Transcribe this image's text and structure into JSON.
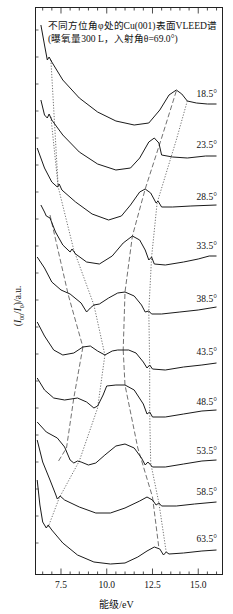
{
  "chart_data": {
    "type": "line",
    "title": "不同方位角φ处的Cu(001)表面VLEED谱",
    "subtitle": "(曝氧量300 L，入射角θ=69.0°)",
    "xlabel": "能级/eV",
    "ylabel": "(I00/I0)/a.u.",
    "xlim": [
      6.1,
      16.3
    ],
    "xticks": [
      7.5,
      10.0,
      12.5,
      15.0
    ],
    "xtick_labels": [
      "7.5",
      "10.0",
      "12.5",
      "15.0"
    ],
    "grid": false,
    "legend": "curve labels at right end",
    "y_note": "curves vertically offset (arbitrary units); y values below are screen-space offsets",
    "series": [
      {
        "name": "18.5°",
        "label_y": 100,
        "points": [
          [
            6.4,
            25
          ],
          [
            6.6,
            45
          ],
          [
            6.75,
            60
          ],
          [
            6.85,
            57
          ],
          [
            7.0,
            62
          ],
          [
            7.6,
            80
          ],
          [
            8.5,
            98
          ],
          [
            9.5,
            112
          ],
          [
            10.5,
            121
          ],
          [
            11.5,
            125
          ],
          [
            12.3,
            123
          ],
          [
            12.9,
            110
          ],
          [
            13.4,
            95
          ],
          [
            13.8,
            90
          ],
          [
            14.1,
            94
          ],
          [
            14.4,
            101
          ],
          [
            14.9,
            103
          ],
          [
            15.5,
            104
          ],
          [
            16.0,
            104
          ]
        ]
      },
      {
        "name": "23.5°",
        "label_y": 151,
        "points": [
          [
            6.4,
            100
          ],
          [
            6.6,
            115
          ],
          [
            6.75,
            118
          ],
          [
            6.85,
            114
          ],
          [
            7.0,
            120
          ],
          [
            7.6,
            135
          ],
          [
            8.5,
            152
          ],
          [
            9.5,
            164
          ],
          [
            10.5,
            170
          ],
          [
            11.3,
            168
          ],
          [
            11.8,
            158
          ],
          [
            12.3,
            142
          ],
          [
            12.6,
            138
          ],
          [
            12.85,
            143
          ],
          [
            13.0,
            155
          ],
          [
            13.6,
            157
          ],
          [
            14.4,
            158
          ],
          [
            15.4,
            156
          ],
          [
            16.0,
            156
          ]
        ]
      },
      {
        "name": "28.5°",
        "label_y": 203,
        "points": [
          [
            6.2,
            148
          ],
          [
            6.6,
            168
          ],
          [
            7.0,
            182
          ],
          [
            7.3,
            187
          ],
          [
            7.4,
            184
          ],
          [
            7.55,
            190
          ],
          [
            8.3,
            202
          ],
          [
            9.2,
            214
          ],
          [
            10.1,
            220
          ],
          [
            10.8,
            216
          ],
          [
            11.3,
            205
          ],
          [
            11.8,
            192
          ],
          [
            12.1,
            189
          ],
          [
            12.4,
            193
          ],
          [
            12.7,
            203
          ],
          [
            12.8,
            201
          ],
          [
            13.0,
            207
          ],
          [
            13.6,
            207
          ],
          [
            14.6,
            206
          ],
          [
            16.0,
            205
          ]
        ]
      },
      {
        "name": "33.5°",
        "label_y": 252,
        "points": [
          [
            6.4,
            205
          ],
          [
            6.6,
            212
          ],
          [
            6.7,
            216
          ],
          [
            6.9,
            218
          ],
          [
            7.2,
            232
          ],
          [
            7.6,
            245
          ],
          [
            8.0,
            252
          ],
          [
            8.1,
            249
          ],
          [
            8.3,
            254
          ],
          [
            8.9,
            262
          ],
          [
            9.6,
            264
          ],
          [
            10.3,
            256
          ],
          [
            10.9,
            243
          ],
          [
            11.4,
            236
          ],
          [
            11.8,
            240
          ],
          [
            12.1,
            250
          ],
          [
            12.3,
            260
          ],
          [
            12.45,
            257
          ],
          [
            12.6,
            264
          ],
          [
            13.2,
            265
          ],
          [
            14.2,
            262
          ],
          [
            15.0,
            259
          ],
          [
            15.6,
            256
          ],
          [
            16.0,
            256
          ]
        ]
      },
      {
        "name": "38.5°",
        "label_y": 305,
        "points": [
          [
            6.2,
            257
          ],
          [
            6.6,
            268
          ],
          [
            7.0,
            282
          ],
          [
            7.5,
            290
          ],
          [
            8.0,
            294
          ],
          [
            8.6,
            303
          ],
          [
            8.9,
            312
          ],
          [
            9.1,
            308
          ],
          [
            9.3,
            305
          ],
          [
            9.6,
            304
          ],
          [
            10.1,
            298
          ],
          [
            10.6,
            293
          ],
          [
            11.0,
            292
          ],
          [
            11.5,
            296
          ],
          [
            11.9,
            305
          ],
          [
            12.1,
            312
          ],
          [
            12.3,
            311
          ],
          [
            12.45,
            314
          ],
          [
            13.0,
            314
          ],
          [
            14.0,
            312
          ],
          [
            15.0,
            310
          ],
          [
            16.0,
            307
          ]
        ]
      },
      {
        "name": "43.5°",
        "label_y": 358,
        "points": [
          [
            6.2,
            322
          ],
          [
            6.6,
            336
          ],
          [
            7.1,
            350
          ],
          [
            7.6,
            355
          ],
          [
            8.2,
            353
          ],
          [
            8.7,
            347
          ],
          [
            9.1,
            346
          ],
          [
            9.5,
            351
          ],
          [
            9.9,
            355
          ],
          [
            10.3,
            351
          ],
          [
            10.6,
            350
          ],
          [
            11.2,
            350
          ],
          [
            11.6,
            353
          ],
          [
            12.0,
            362
          ],
          [
            12.2,
            368
          ],
          [
            12.35,
            365
          ],
          [
            12.5,
            369
          ],
          [
            13.2,
            370
          ],
          [
            14.2,
            367
          ],
          [
            15.2,
            365
          ],
          [
            16.0,
            363
          ]
        ]
      },
      {
        "name": "48.5°",
        "label_y": 408,
        "points": [
          [
            6.2,
            378
          ],
          [
            6.6,
            390
          ],
          [
            7.1,
            398
          ],
          [
            7.7,
            400
          ],
          [
            8.4,
            398
          ],
          [
            8.9,
            402
          ],
          [
            9.3,
            408
          ],
          [
            9.5,
            406
          ],
          [
            9.8,
            395
          ],
          [
            10.0,
            386
          ],
          [
            10.5,
            385
          ],
          [
            11.0,
            385
          ],
          [
            11.5,
            390
          ],
          [
            12.0,
            404
          ],
          [
            12.2,
            414
          ],
          [
            12.35,
            412
          ],
          [
            12.5,
            417
          ],
          [
            13.2,
            417
          ],
          [
            14.2,
            414
          ],
          [
            15.2,
            411
          ],
          [
            16.0,
            410
          ]
        ]
      },
      {
        "name": "53.5°",
        "label_y": 457,
        "points": [
          [
            6.2,
            422
          ],
          [
            6.7,
            432
          ],
          [
            7.3,
            438
          ],
          [
            7.7,
            447
          ],
          [
            8.0,
            460
          ],
          [
            8.2,
            463
          ],
          [
            8.4,
            461
          ],
          [
            8.6,
            462
          ],
          [
            9.0,
            465
          ],
          [
            9.4,
            463
          ],
          [
            9.9,
            455
          ],
          [
            10.5,
            446
          ],
          [
            11.0,
            444
          ],
          [
            11.5,
            448
          ],
          [
            11.9,
            458
          ],
          [
            12.1,
            465
          ],
          [
            12.25,
            462
          ],
          [
            12.5,
            467
          ],
          [
            13.2,
            467
          ],
          [
            14.2,
            464
          ],
          [
            15.2,
            461
          ],
          [
            16.0,
            460
          ]
        ]
      },
      {
        "name": "58.5°",
        "label_y": 498,
        "points": [
          [
            6.2,
            440
          ],
          [
            6.5,
            462
          ],
          [
            6.9,
            480
          ],
          [
            7.2,
            494
          ],
          [
            7.3,
            499
          ],
          [
            7.45,
            496
          ],
          [
            7.7,
            500
          ],
          [
            8.5,
            507
          ],
          [
            9.4,
            513
          ],
          [
            10.2,
            513
          ],
          [
            11.0,
            508
          ],
          [
            11.8,
            501
          ],
          [
            12.2,
            497
          ],
          [
            12.5,
            500
          ],
          [
            12.7,
            505
          ],
          [
            12.85,
            503
          ],
          [
            13.0,
            506
          ],
          [
            13.8,
            506
          ],
          [
            14.8,
            504
          ],
          [
            16.0,
            502
          ]
        ]
      },
      {
        "name": "63.5°",
        "label_y": 545,
        "points": [
          [
            6.2,
            480
          ],
          [
            6.35,
            505
          ],
          [
            6.5,
            522
          ],
          [
            6.7,
            528
          ],
          [
            6.8,
            525
          ],
          [
            7.0,
            530
          ],
          [
            7.6,
            543
          ],
          [
            8.4,
            555
          ],
          [
            9.3,
            562
          ],
          [
            10.2,
            564
          ],
          [
            11.0,
            563
          ],
          [
            11.7,
            557
          ],
          [
            12.2,
            551
          ],
          [
            12.6,
            547
          ],
          [
            12.9,
            549
          ],
          [
            13.1,
            555
          ],
          [
            13.25,
            552
          ],
          [
            13.4,
            554
          ],
          [
            14.2,
            553
          ],
          [
            15.2,
            551
          ],
          [
            16.0,
            550
          ]
        ]
      }
    ],
    "guide_lines": [
      {
        "style": "dotted",
        "points": [
          [
            6.95,
            60
          ],
          [
            7.35,
            187
          ],
          [
            8.2,
            250
          ],
          [
            9.3,
            305
          ]
        ]
      },
      {
        "style": "dotted",
        "points": [
          [
            9.3,
            305
          ],
          [
            9.9,
            355
          ]
        ]
      },
      {
        "style": "dotted",
        "points": [
          [
            9.9,
            355
          ],
          [
            9.5,
            408
          ],
          [
            8.5,
            461
          ],
          [
            7.4,
            498
          ],
          [
            6.8,
            527
          ]
        ]
      },
      {
        "style": "dotted",
        "points": [
          [
            6.95,
            117
          ],
          [
            7.35,
            187
          ]
        ]
      },
      {
        "style": "dashed",
        "points": [
          [
            6.9,
            215
          ],
          [
            7.9,
            295
          ],
          [
            8.7,
            347
          ]
        ]
      },
      {
        "style": "dashed",
        "points": [
          [
            8.7,
            347
          ],
          [
            8.2,
            398
          ],
          [
            7.8,
            448
          ],
          [
            7.3,
            463
          ]
        ]
      },
      {
        "style": "dashed",
        "points": [
          [
            13.8,
            91
          ],
          [
            13.0,
            138
          ],
          [
            12.1,
            189
          ],
          [
            11.4,
            236
          ],
          [
            11.0,
            292
          ],
          [
            10.9,
            350
          ]
        ]
      },
      {
        "style": "dashed",
        "points": [
          [
            10.9,
            350
          ],
          [
            11.0,
            385
          ],
          [
            11.7,
            448
          ],
          [
            12.5,
            497
          ],
          [
            12.85,
            548
          ]
        ]
      },
      {
        "style": "dotted",
        "points": [
          [
            14.4,
            101
          ],
          [
            13.8,
            140
          ],
          [
            13.2,
            176
          ],
          [
            12.75,
            203
          ],
          [
            12.45,
            257
          ],
          [
            12.3,
            311
          ],
          [
            12.35,
            366
          ],
          [
            12.35,
            413
          ],
          [
            12.4,
            463
          ],
          [
            12.85,
            503
          ],
          [
            13.25,
            552
          ]
        ]
      }
    ]
  }
}
